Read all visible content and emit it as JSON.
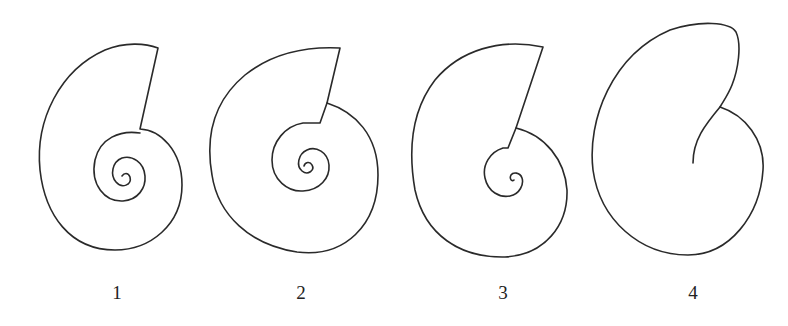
{
  "figure": {
    "stroke_color": "#2a2a2a",
    "background": "#ffffff",
    "shells": [
      {
        "id": 1,
        "label": "1"
      },
      {
        "id": 2,
        "label": "2"
      },
      {
        "id": 3,
        "label": "3"
      },
      {
        "id": 4,
        "label": "4"
      }
    ]
  }
}
